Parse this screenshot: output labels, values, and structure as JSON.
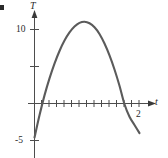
{
  "figure": {
    "corner_mark": "•",
    "background_color": "#ffffff",
    "curve_color": "#5b5b5b",
    "axis_color": "#4d4d4d",
    "text_color": "#2b2b2b"
  },
  "labels": {
    "y_axis": "T",
    "x_axis": "t",
    "y_tick_10": "10",
    "y_tick_neg5": "-5",
    "x_tick_2": "2"
  },
  "chart_data": {
    "type": "line",
    "title": "",
    "xlabel": "t",
    "ylabel": "T",
    "xlim": [
      -0.05,
      2.4
    ],
    "ylim": [
      -6.5,
      12.5
    ],
    "grid": false,
    "legend": null,
    "x_ticks": [
      0.1,
      0.25,
      0.4,
      0.55,
      0.7,
      0.85,
      1.0,
      1.15,
      1.3,
      1.45,
      1.6,
      1.75,
      1.9,
      2.0
    ],
    "x_tick_labels": [
      "",
      "",
      "",
      "",
      "",
      "",
      "",
      "",
      "",
      "",
      "",
      "",
      "",
      "2"
    ],
    "y_ticks": [
      -5,
      5,
      10
    ],
    "y_tick_labels": [
      "-5",
      "",
      "10"
    ],
    "series": [
      {
        "name": "T(t)",
        "x": [
          0.0,
          0.1,
          0.2,
          0.3,
          0.4,
          0.5,
          0.6,
          0.7,
          0.8,
          0.9,
          1.0,
          1.1,
          1.2,
          1.3,
          1.4,
          1.5,
          1.6,
          1.7,
          1.8,
          1.9,
          2.0,
          2.1
        ],
        "y": [
          -4.6,
          -1.6,
          1.1,
          3.4,
          5.4,
          7.1,
          8.5,
          9.6,
          10.4,
          10.9,
          11.05,
          10.85,
          10.3,
          9.4,
          8.1,
          6.5,
          4.6,
          2.4,
          -0.1,
          -1.8,
          -2.9,
          -4.0
        ]
      }
    ],
    "annotations": [
      {
        "text": "10",
        "axis": "y",
        "value": 10
      },
      {
        "text": "-5",
        "axis": "y",
        "value": -5
      },
      {
        "text": "2",
        "axis": "x",
        "value": 2.0
      }
    ]
  }
}
